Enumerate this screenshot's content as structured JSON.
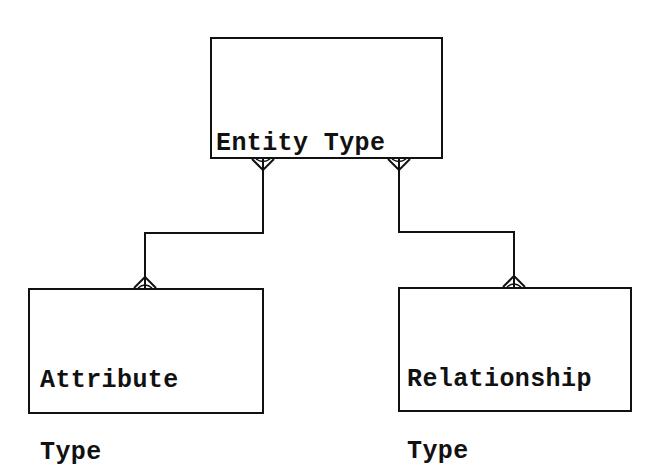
{
  "diagram": {
    "type": "entity-relationship",
    "notation": "crow's foot",
    "colors": {
      "background": "#ffffff",
      "stroke": "#111111",
      "text": "#111111"
    },
    "entities": [
      {
        "id": "entity_type",
        "lines": [
          "Entity Type"
        ],
        "box": {
          "x": 210,
          "y": 37,
          "w": 233,
          "h": 122
        },
        "text_pos": {
          "x": 216,
          "y": 84
        }
      },
      {
        "id": "attribute_type",
        "lines": [
          "Attribute",
          "Type"
        ],
        "box": {
          "x": 28,
          "y": 288,
          "w": 236,
          "h": 126
        },
        "text_pos": {
          "x": 40,
          "y": 321
        }
      },
      {
        "id": "relationship_type",
        "lines": [
          "Relationship",
          "Type"
        ],
        "box": {
          "x": 398,
          "y": 287,
          "w": 234,
          "h": 125
        },
        "text_pos": {
          "x": 407,
          "y": 320
        }
      }
    ],
    "relationships": [
      {
        "from": "entity_type",
        "to": "attribute_type",
        "from_end": "many",
        "to_end": "many",
        "path": [
          [
            263,
            159
          ],
          [
            263,
            233
          ],
          [
            145,
            233
          ],
          [
            145,
            288
          ]
        ]
      },
      {
        "from": "entity_type",
        "to": "relationship_type",
        "from_end": "many",
        "to_end": "many",
        "path": [
          [
            399,
            159
          ],
          [
            399,
            232
          ],
          [
            514,
            232
          ],
          [
            514,
            287
          ]
        ]
      }
    ]
  }
}
